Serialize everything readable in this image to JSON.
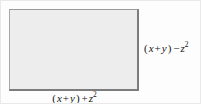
{
  "figure": {
    "type": "geometry-diagram",
    "shape": "rectangle",
    "fill_color": "#ededed",
    "border_color": "#7c7c7c",
    "labels": {
      "right_side": {
        "full_text": "(x + y) − z2",
        "open_paren": "(",
        "var1": "x",
        "operator_inner": "+",
        "var2": "y",
        "close_paren": ")",
        "operator_outer": "−",
        "var3": "z",
        "exponent": "2"
      },
      "bottom_side": {
        "full_text": "(x + y) + z2",
        "open_paren": "(",
        "var1": "x",
        "operator_inner": "+",
        "var2": "y",
        "close_paren": ")",
        "operator_outer": "+",
        "var3": "z",
        "exponent": "2"
      }
    }
  }
}
